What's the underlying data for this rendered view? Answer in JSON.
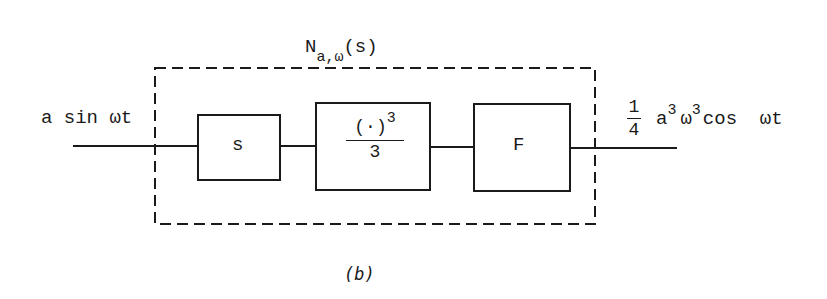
{
  "diagram": {
    "title": {
      "base": "N",
      "subscript": "a,ω",
      "argument": "(s)"
    },
    "input_label": "a sin ωt",
    "blocks": [
      {
        "id": "derivative",
        "label": "s"
      },
      {
        "id": "cube",
        "numerator": "(·)",
        "numerator_exp": "3",
        "denominator": "3"
      },
      {
        "id": "filter",
        "label": "F"
      }
    ],
    "output_label": {
      "coef_num": "1",
      "coef_den": "4",
      "a": "a",
      "a_exp": "3",
      "omega": "ω",
      "omega_exp": "3",
      "rest": "cos  ωt"
    },
    "caption": "(b)",
    "colors": {
      "stroke": "#1a1a1a",
      "background": "#ffffff"
    }
  }
}
